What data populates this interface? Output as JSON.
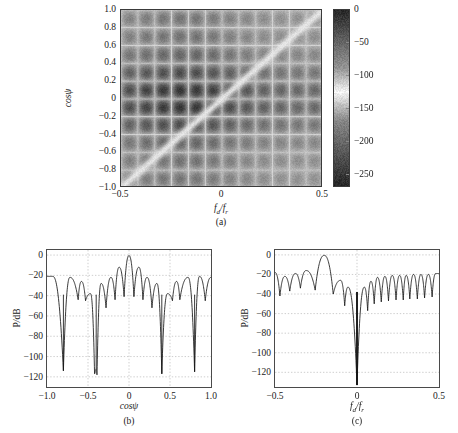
{
  "figure": {
    "kind": "multi-panel-scientific-figure",
    "panel_labels": [
      "(a)",
      "(b)",
      "(c)"
    ]
  },
  "panel_a": {
    "label": "(a)",
    "xlabel_html": "f<sub>d</sub>/f<sub>r</sub>",
    "ylabel_html": "cos&#968;",
    "xticks": [
      "-0.5",
      "0",
      "0.5"
    ],
    "xtick_values": [
      -0.5,
      0,
      0.5
    ],
    "yticks": [
      "1.0",
      "0.8",
      "0.6",
      "0.4",
      "0.2",
      "0",
      "-0.2",
      "-0.4",
      "-0.6",
      "-0.8",
      "-1.0"
    ],
    "ytick_values": [
      1.0,
      0.8,
      0.6,
      0.4,
      0.2,
      0,
      -0.2,
      -0.4,
      -0.6,
      -0.8,
      -1.0
    ],
    "colorbar": {
      "ticks": [
        "0",
        "-50",
        "-100",
        "-150",
        "-200",
        "-250"
      ],
      "tick_values": [
        0,
        -50,
        -100,
        -150,
        -200,
        -250
      ],
      "vmin": -270,
      "vmax": 0,
      "unit": "dB"
    }
  },
  "panel_b": {
    "label": "(b)",
    "xlabel_html": "cos&#968;",
    "ylabel_html": "<span class=\"upr\">P</span>/<span class=\"upr\">dB</span>",
    "xticks": [
      "-1.0",
      "-0.5",
      "0",
      "0.5",
      "1.0"
    ],
    "xtick_values": [
      -1.0,
      -0.5,
      0,
      0.5,
      1.0
    ],
    "yticks": [
      "0",
      "-20",
      "-40",
      "-60",
      "-80",
      "-100",
      "-120"
    ],
    "ytick_values": [
      0,
      -20,
      -40,
      -60,
      -80,
      -100,
      -120
    ]
  },
  "panel_c": {
    "label": "(c)",
    "xlabel_html": "f<sub>d</sub>/f<sub>r</sub>",
    "ylabel_html": "<span class=\"upr\">P</span>/<span class=\"upr\">dB</span>",
    "xticks": [
      "-0.5",
      "0",
      "0.5"
    ],
    "xtick_values": [
      -0.5,
      0,
      0.5
    ],
    "yticks": [
      "0",
      "-20",
      "-40",
      "-60",
      "-80",
      "-100",
      "-120"
    ],
    "ytick_values": [
      0,
      -20,
      -40,
      -60,
      -80,
      -100,
      -120
    ]
  },
  "chart_data": [
    {
      "id": "panel-a",
      "type": "heatmap",
      "title": "",
      "xlabel": "fd/fr",
      "ylabel": "cos(psi)",
      "zlabel": "P/dB",
      "xlim": [
        -0.5,
        0.5
      ],
      "ylim": [
        -1.0,
        1.0
      ],
      "zlim": [
        -270,
        0
      ],
      "colormap": "gray-inverted-dark-is-high",
      "grid": true,
      "description": "Space-time adapted-pattern / clutter ridge: bright (low-value) diagonal notch running from (-0.5,-1.0) to (0.5,1.0); dark (high-value) blocky lattice of grating lobes elsewhere, strongest near cos(psi)=0 and fd/fr near -0.2.",
      "features": {
        "diagonal_ridge_endpoints": [
          [
            -0.5,
            -1.0
          ],
          [
            0.5,
            1.0
          ]
        ],
        "ridge_is_bright_null": true,
        "lattice_period_x": 0.0833,
        "lattice_period_y": 0.2,
        "darkest_region_center": [
          -0.2,
          0.0
        ]
      }
    },
    {
      "id": "panel-b",
      "type": "line",
      "title": "",
      "xlabel": "cos(psi)",
      "ylabel": "P/dB",
      "xlim": [
        -1.0,
        1.0
      ],
      "ylim": [
        -130,
        5
      ],
      "grid": true,
      "series": [
        {
          "name": "beampattern-cut",
          "peaks_x": [
            -0.93,
            -0.72,
            -0.58,
            -0.47,
            -0.34,
            -0.22,
            -0.12,
            0.0,
            0.12,
            0.22,
            0.34,
            0.47,
            0.58,
            0.72,
            0.86,
            1.0
          ],
          "peaks_y": [
            -21,
            -22,
            -26,
            -38,
            -28,
            -22,
            -12,
            -0.5,
            -12,
            -22,
            -28,
            -38,
            -26,
            -22,
            -21,
            -22
          ],
          "nulls_x": [
            -0.8,
            -0.62,
            -0.53,
            -0.42,
            -0.4,
            -0.39,
            -0.28,
            -0.17,
            -0.06,
            0.06,
            0.17,
            0.28,
            0.4,
            0.53,
            0.62,
            0.8,
            0.93
          ],
          "nulls_y": [
            -114,
            -44,
            -45,
            -117,
            -112,
            -118,
            -52,
            -44,
            -41,
            -41,
            -44,
            -52,
            -117,
            -45,
            -44,
            -115,
            -45
          ],
          "mainlobe_center_x": 0.0,
          "mainlobe_peak_db": 0.0,
          "typical_sidelobe_db": -21,
          "deep_null_positions": [
            -0.8,
            -0.4,
            0.4,
            0.8
          ],
          "deep_null_depth_db": -118
        }
      ]
    },
    {
      "id": "panel-c",
      "type": "line",
      "title": "",
      "xlabel": "fd/fr",
      "ylabel": "P/dB",
      "xlim": [
        -0.5,
        0.5
      ],
      "ylim": [
        -135,
        5
      ],
      "grid": true,
      "series": [
        {
          "name": "doppler-response-cut",
          "mainlobe_center_x": -0.2,
          "mainlobe_peak_db": 0.0,
          "deep_null_positions": [
            0.0
          ],
          "deep_null_depth_db": -133,
          "typical_sidelobe_db": -20,
          "peaks_x": [
            -0.5,
            -0.44,
            -0.375,
            -0.31,
            -0.2,
            -0.1,
            -0.055,
            0.045,
            0.085,
            0.125,
            0.17,
            0.215,
            0.26,
            0.3,
            0.345,
            0.39,
            0.435,
            0.48
          ],
          "peaks_y": [
            -18,
            -22,
            -19,
            -16,
            -0.5,
            -26,
            -33,
            -33,
            -27,
            -23,
            -22,
            -21,
            -21,
            -21,
            -20,
            -20,
            -20,
            -19
          ],
          "nulls_x": [
            -0.47,
            -0.41,
            -0.345,
            -0.255,
            -0.145,
            -0.075,
            0.0,
            0.065,
            0.105,
            0.148,
            0.192,
            0.238,
            0.282,
            0.322,
            0.368,
            0.412,
            0.458
          ],
          "nulls_y": [
            -42,
            -37,
            -34,
            -36,
            -40,
            -52,
            -133,
            -57,
            -50,
            -48,
            -47,
            -46,
            -46,
            -45,
            -45,
            -44,
            -43
          ]
        }
      ]
    }
  ]
}
